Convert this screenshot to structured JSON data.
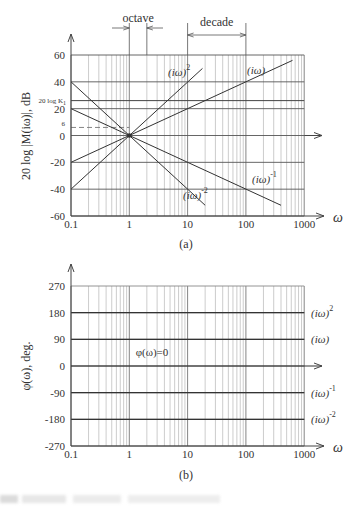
{
  "chart_data": [
    {
      "id": "a",
      "type": "line",
      "caption": "(a)",
      "xscale": "log",
      "x_ticks": [
        "0.1",
        "1",
        "10",
        "100",
        "1000"
      ],
      "xlim": [
        0.1,
        1000
      ],
      "xlabel": "ω",
      "ylabel": "20 log |M(iω)|, dB",
      "y_ticks": [
        "60",
        "40",
        "20",
        "0",
        "-20",
        "-40",
        "-60"
      ],
      "ylim": [
        -60,
        60
      ],
      "grid": true,
      "reference_lines": [
        {
          "label": "20 log K1",
          "y": 26,
          "style": "solid"
        },
        {
          "label": "6",
          "y": 6,
          "style": "dashed",
          "x_end": 1
        }
      ],
      "annotations": [
        {
          "text": "octave",
          "x_from": 1,
          "x_to": 2,
          "arrows": "inward"
        },
        {
          "text": "decade",
          "x_from": 10,
          "x_to": 100,
          "arrows": "outward"
        }
      ],
      "series": [
        {
          "name": "(iω)^2",
          "label_base": "(iω)",
          "label_exp": "2",
          "slope_db_per_decade": 40,
          "x": [
            0.1,
            18
          ],
          "y": [
            -40,
            50
          ]
        },
        {
          "name": "(iω)",
          "label_base": "(iω)",
          "label_exp": "",
          "slope_db_per_decade": 20,
          "x": [
            0.1,
            630
          ],
          "y": [
            -20,
            56
          ]
        },
        {
          "name": "(iω)^-1",
          "label_base": "(iω)",
          "label_exp": "-1",
          "slope_db_per_decade": -20,
          "x": [
            0.1,
            400
          ],
          "y": [
            20,
            -52
          ]
        },
        {
          "name": "(iω)^-2",
          "label_base": "(iω)",
          "label_exp": "-2",
          "slope_db_per_decade": -40,
          "x": [
            0.1,
            20
          ],
          "y": [
            40,
            -52
          ]
        }
      ]
    },
    {
      "id": "b",
      "type": "line",
      "caption": "(b)",
      "xscale": "log",
      "x_ticks": [
        "0.1",
        "1",
        "10",
        "100",
        "1000"
      ],
      "xlim": [
        0.1,
        1000
      ],
      "xlabel": "ω",
      "ylabel": "φ(ω), deg.",
      "y_ticks": [
        "270",
        "180",
        "90",
        "0",
        "-90",
        "-180",
        "-270"
      ],
      "ylim": [
        -270,
        270
      ],
      "grid": true,
      "annotations": [
        {
          "text": "φ(ω)=0",
          "x": 1,
          "y": 0
        }
      ],
      "series": [
        {
          "name": "(iω)^2",
          "label_base": "(iω)",
          "label_exp": "2",
          "value_deg": 180
        },
        {
          "name": "(iω)",
          "label_base": "(iω)",
          "label_exp": "",
          "value_deg": 90
        },
        {
          "name": "(iω)^-1",
          "label_base": "(iω)",
          "label_exp": "-1",
          "value_deg": -90
        },
        {
          "name": "(iω)^-2",
          "label_base": "(iω)",
          "label_exp": "-2",
          "value_deg": -180
        }
      ]
    }
  ],
  "labels": {
    "octave": "octave",
    "decade": "decade",
    "ref_k1": "20 log K",
    "ref_k1_sub": "1",
    "ref_six": "6",
    "phi_zero": "φ(ω)=0",
    "omega": "ω",
    "caption_a": "(a)",
    "caption_b": "(b)",
    "ylabel_a": "20 log |M(iω)|, dB",
    "ylabel_b": "φ(ω), deg."
  }
}
